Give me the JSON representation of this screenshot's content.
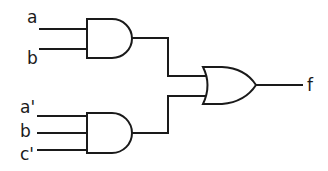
{
  "diagram": {
    "type": "logic-circuit",
    "inputs_gate1": [
      "a",
      "b"
    ],
    "inputs_gate2": [
      "a'",
      "b",
      "c'"
    ],
    "output": "f",
    "gates": [
      {
        "id": "and1",
        "type": "AND",
        "inputs": [
          "a",
          "b"
        ]
      },
      {
        "id": "and2",
        "type": "AND",
        "inputs": [
          "a'",
          "b",
          "c'"
        ]
      },
      {
        "id": "or1",
        "type": "OR",
        "inputs": [
          "and1",
          "and2"
        ],
        "output": "f"
      }
    ],
    "colors": {
      "line": "#1a1a1a",
      "background": "#ffffff"
    }
  }
}
